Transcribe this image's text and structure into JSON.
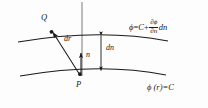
{
  "figure": {
    "background_color": "#fdfdfd",
    "ink_color": "#1a1a1a"
  },
  "labels": {
    "upper_surface": {
      "phi": "ϕ",
      "equals": "=",
      "constant": "C",
      "plus": "+",
      "numerator": "∂ϕ",
      "denominator": "∂n",
      "differential": "dn"
    },
    "lower_surface": {
      "text": "ϕ (r)=C"
    },
    "point_q": "Q",
    "point_p": "P",
    "vector_dr": "dr",
    "vector_n": "n",
    "distance_dn": "dn"
  },
  "geometry": {
    "upper_curve_path": "M 18 42 Q 100 28 168 41",
    "lower_curve_path": "M 20 76 Q 100 62 166 75",
    "axis_line": {
      "x": 82,
      "y_top": 2,
      "y_bottom": 76
    },
    "dr_arrow": {
      "from_x": 79,
      "from_y": 74,
      "to_x": 51,
      "to_y": 31
    },
    "n_arrow": {
      "from_x": 81,
      "from_y": 73,
      "to_x": 81,
      "to_y": 52
    },
    "dn_measure": {
      "x": 101,
      "y_top": 34,
      "y_bottom": 72
    },
    "point_q_marker": {
      "x": 51,
      "y": 31
    },
    "point_p_marker": {
      "x": 80,
      "y": 74
    }
  }
}
